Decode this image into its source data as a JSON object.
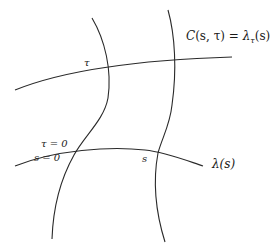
{
  "diagram": {
    "labels": {
      "surface": "C(s, τ) = λτ(s)",
      "surface_parts": {
        "C": "C",
        "args": "(s, τ)",
        "eq": " = ",
        "lambda": "λ",
        "sub": "τ",
        "arg": "(s)"
      },
      "tau_curve": "τ",
      "tau_zero": "τ = 0",
      "s_zero": "s = 0",
      "s_point": "s",
      "base_curve": "λ(s)"
    },
    "curves": {
      "top_curve": "curve through τ label toward C(s,τ) label",
      "bottom_curve": "base curve λ(s)",
      "left_vertical": "curve through s = 0 / τ = 0 intersection",
      "right_vertical": "curve through s intersection"
    },
    "colors": {
      "stroke": "#2a2a2a",
      "text": "#1a1a1a",
      "background": "#ffffff"
    }
  }
}
